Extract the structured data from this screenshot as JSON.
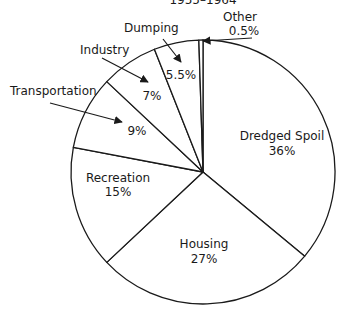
{
  "chart_data": {
    "type": "pie",
    "title": "1955–1964",
    "start_angle_deg": 0,
    "direction": "clockwise",
    "slices": [
      {
        "label": "Dredged Spoil",
        "value": 36,
        "display": "36%"
      },
      {
        "label": "Housing",
        "value": 27,
        "display": "27%"
      },
      {
        "label": "Recreation",
        "value": 15,
        "display": "15%"
      },
      {
        "label": "Transportation",
        "value": 9,
        "display": "9%"
      },
      {
        "label": "Industry",
        "value": 7,
        "display": "7%"
      },
      {
        "label": "Dumping",
        "value": 5.5,
        "display": "5.5%"
      },
      {
        "label": "Other",
        "value": 0.5,
        "display": "0.5%"
      }
    ],
    "fill": "#ffffff",
    "stroke": "#1a1a1a"
  },
  "geometry": {
    "cx": 203,
    "cy": 172,
    "r": 132
  },
  "labels": {
    "title": "1955–1964",
    "dredged_spoil": {
      "name": "Dredged Spoil",
      "pct": "36%"
    },
    "housing": {
      "name": "Housing",
      "pct": "27%"
    },
    "recreation": {
      "name": "Recreation",
      "pct": "15%"
    },
    "transportation": {
      "name": "Transportation",
      "pct": "9%"
    },
    "industry": {
      "name": "Industry",
      "pct": "7%"
    },
    "dumping": {
      "name": "Dumping",
      "pct": "5.5%"
    },
    "other": {
      "name": "Other",
      "pct": "0.5%"
    }
  }
}
